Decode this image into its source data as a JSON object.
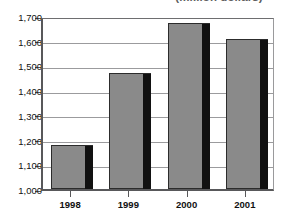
{
  "chart_data": {
    "type": "bar",
    "title": "(million dollars)",
    "xlabel": "",
    "ylabel": "",
    "categories": [
      "1998",
      "1999",
      "2000",
      "2001"
    ],
    "values": [
      1180,
      1470,
      1670,
      1605
    ],
    "series": [
      {
        "name": "Value",
        "values": [
          1180,
          1470,
          1670,
          1605
        ]
      }
    ],
    "ylim": [
      1000,
      1700
    ],
    "ytick_values": [
      1000,
      1100,
      1200,
      1300,
      1400,
      1500,
      1600,
      1700
    ],
    "ytick_labels": [
      "1,000",
      "1,100",
      "1,200",
      "1,300",
      "1,400",
      "1,500",
      "1,600",
      "1,700"
    ],
    "grid": true,
    "legend": false,
    "legend_position": "none",
    "bar_color": "#8a8a8a",
    "bar_outline_color": "#2c2c2c",
    "bar_shadow_color": "#111111",
    "gridline_color": "#9b9b9d",
    "axis_color": "#58585a",
    "background_color": "#ffffff",
    "text_color": "#111111",
    "title_color": "#5f5f5f"
  }
}
